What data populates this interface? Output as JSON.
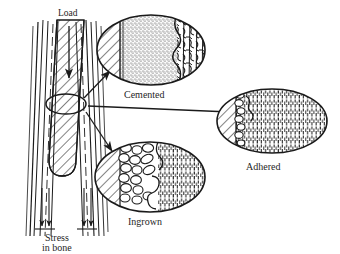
{
  "figure": {
    "background_color": "#ffffff",
    "ink_color": "#1a1a1a",
    "width": 340,
    "height": 254
  },
  "labels": {
    "load": "Load",
    "stress_line1": "Stress",
    "stress_line2": "in bone",
    "cemented": "Cemented",
    "adhered": "Adhered",
    "ingrown": "Ingrown"
  },
  "bone_diagram": {
    "name": "femur-with-implant-stem",
    "load_arrow_direction": "down",
    "stress_arrows_direction": "down",
    "stress_arrow_count": 4,
    "callout_ellipse": {
      "cx": 66,
      "cy": 104,
      "rx": 20,
      "ry": 10
    }
  },
  "callouts": [
    {
      "key": "cemented",
      "label": "Cemented",
      "ellipse": {
        "cx": 151,
        "cy": 50,
        "rx": 54,
        "ry": 35
      },
      "zones": [
        "metal-hatch",
        "cement-stipple",
        "bone-trabecular"
      ],
      "arrow_from": [
        84,
        98
      ],
      "arrow_to": [
        112,
        72
      ]
    },
    {
      "key": "adhered",
      "label": "Adhered",
      "ellipse": {
        "cx": 272,
        "cy": 121,
        "rx": 55,
        "ry": 32
      },
      "zones": [
        "metal-hatch",
        "interface-cells",
        "bone-vertical"
      ],
      "arrow_from": [
        88,
        106
      ],
      "arrow_to": [
        232,
        112
      ]
    },
    {
      "key": "ingrown",
      "label": "Ingrown",
      "ellipse": {
        "cx": 150,
        "cy": 177,
        "rx": 55,
        "ry": 35
      },
      "zones": [
        "metal-hatch",
        "porous-beads",
        "bone-vertical"
      ],
      "arrow_from": [
        86,
        112
      ],
      "arrow_to": [
        112,
        152
      ]
    }
  ]
}
